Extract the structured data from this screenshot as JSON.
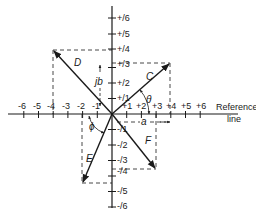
{
  "diagram": {
    "type": "complex-plane phasor diagram",
    "origin_px": [
      112,
      114
    ],
    "unit_px": {
      "x": 14.7,
      "y": 15.5
    },
    "x_axis": {
      "label_line1": "Reference",
      "label_line2": "line",
      "negative_ticks": [
        "-6",
        "-5",
        "-4",
        "-3",
        "-2",
        "-1"
      ],
      "positive_ticks": [
        "+1",
        "+2",
        "+3",
        "+4",
        "+5",
        "+6"
      ]
    },
    "y_axis": {
      "positive_ticks": [
        "+j1",
        "+j2",
        "+j3",
        "+j4",
        "+j5",
        "+j6"
      ],
      "negative_ticks": [
        "-j1",
        "-j2",
        "-j3",
        "-j4",
        "-j5",
        "-j6"
      ],
      "positive_display": [
        "+/1",
        "+/2",
        "+/3",
        "+/4",
        "+/5",
        "+/6"
      ],
      "negative_display": [
        "-/1",
        "-/2",
        "-/3",
        "-/4",
        "-/5",
        "-/6"
      ]
    },
    "phasors": [
      {
        "name": "C",
        "x": 3,
        "y": 3
      },
      {
        "name": "D",
        "x": -4,
        "y": 4
      },
      {
        "name": "E",
        "x": -2,
        "y": -5
      },
      {
        "name": "F",
        "x": 3,
        "y": -4
      }
    ],
    "annotations": {
      "theta": "θ",
      "phi": "ϕ",
      "a": "a",
      "jb": "jb"
    }
  }
}
